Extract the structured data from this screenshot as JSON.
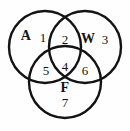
{
  "figure": {
    "type": "venn-diagram-3-set",
    "background_color": "#fefefe",
    "stroke_color": "#131313"
  },
  "sets": [
    {
      "key": "A",
      "label": "A",
      "x": 26,
      "y": 36
    },
    {
      "key": "W",
      "label": "W",
      "x": 88,
      "y": 39
    },
    {
      "key": "F",
      "label": "F",
      "x": 65,
      "y": 88
    }
  ],
  "regions": [
    {
      "id": "a-only",
      "label": "1",
      "x": 43,
      "y": 37
    },
    {
      "id": "a-w",
      "label": "2",
      "x": 65,
      "y": 39
    },
    {
      "id": "w-only",
      "label": "3",
      "x": 105,
      "y": 39
    },
    {
      "id": "a-w-f",
      "label": "4",
      "x": 65,
      "y": 66
    },
    {
      "id": "a-f",
      "label": "5",
      "x": 46,
      "y": 70
    },
    {
      "id": "w-f",
      "label": "6",
      "x": 85,
      "y": 70
    },
    {
      "id": "f-only",
      "label": "7",
      "x": 65,
      "y": 102
    }
  ],
  "circles": [
    {
      "id": "circle-a",
      "cx": 45,
      "cy": 47,
      "r": 36
    },
    {
      "id": "circle-w",
      "cx": 85,
      "cy": 47,
      "r": 36
    },
    {
      "id": "circle-f",
      "cx": 65,
      "cy": 82,
      "r": 36
    }
  ]
}
